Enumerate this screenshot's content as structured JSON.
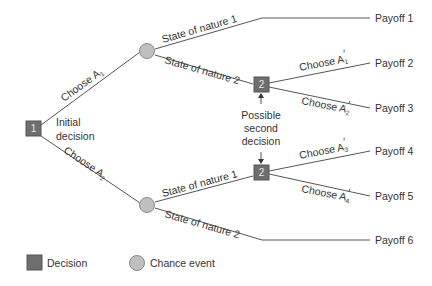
{
  "colors": {
    "line": "#555555",
    "decision_fill": "#6e6e6e",
    "decision_stroke": "#555555",
    "chance_fill": "#bfbfbf",
    "chance_stroke": "#8a8a8a",
    "text": "#333333"
  },
  "nodes": {
    "decision1": {
      "number": "1",
      "label_line1": "Initial",
      "label_line2": "decision"
    },
    "decision2_top": {
      "number": "2"
    },
    "decision2_bottom": {
      "number": "2"
    },
    "annotation": {
      "line1": "Possible",
      "line2": "second",
      "line3": "decision"
    }
  },
  "branches": {
    "choose_a1": {
      "text": "Choose A",
      "sub": "1",
      "prime": ""
    },
    "choose_a2": {
      "text": "Choose A",
      "sub": "2",
      "prime": ""
    },
    "state1_top": {
      "text": "State of nature 1"
    },
    "state2_top": {
      "text": "State of nature 2"
    },
    "state1_bottom": {
      "text": "State of nature 1"
    },
    "state2_bottom": {
      "text": "State of nature 2"
    },
    "choose_a1p": {
      "text": "Choose A",
      "sub": "1",
      "prime": "′"
    },
    "choose_a2p": {
      "text": "Choose A",
      "sub": "2",
      "prime": "′"
    },
    "choose_a3p": {
      "text": "Choose A",
      "sub": "3",
      "prime": "′"
    },
    "choose_a4p": {
      "text": "Choose A",
      "sub": "4",
      "prime": "′"
    }
  },
  "payoffs": [
    "Payoff 1",
    "Payoff 2",
    "Payoff 3",
    "Payoff 4",
    "Payoff 5",
    "Payoff 6"
  ],
  "legend": {
    "decision": "Decision",
    "chance": "Chance event"
  }
}
